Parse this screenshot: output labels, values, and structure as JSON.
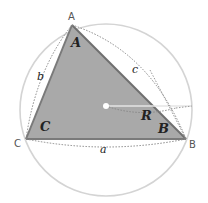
{
  "diagram": {
    "colors": {
      "background": "#ffffff",
      "circle": "#d4d4d4",
      "triangle_fill": "#a9a9a9",
      "triangle_edge": "#777777",
      "dotted": "#888888",
      "radius": "#e8e8e8"
    },
    "vertices": {
      "A": "A",
      "B": "B",
      "C": "C"
    },
    "angles": {
      "A": "A",
      "B": "B",
      "C": "C"
    },
    "sides": {
      "a": "a",
      "b": "b",
      "c": "c"
    },
    "radius_label": "R"
  }
}
